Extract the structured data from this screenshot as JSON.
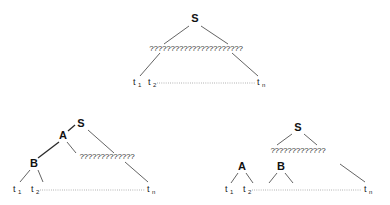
{
  "figure": {
    "title": "",
    "background_color": "#ffffff",
    "edge_color": "#3c3c3c",
    "label_color": "#111111",
    "baseline_color": "#7a7a7a"
  },
  "labels": {
    "S": "S",
    "A": "A",
    "B": "B",
    "t1": "t",
    "t1_sub": "1",
    "t2": "t",
    "t2_sub": "2",
    "tn": "t",
    "tn_sub": "n"
  },
  "diagrams": [
    {
      "id": "top-diagram",
      "name": "single-nonterminal-span",
      "root": "S",
      "squiggle": "??????????????????????",
      "terminals": [
        "t1",
        "t2",
        "tn"
      ]
    },
    {
      "id": "bottom-left-diagram",
      "name": "nested-nonterminals-span",
      "root": "S",
      "nodes": [
        "A",
        "B"
      ],
      "squiggle": "?????????????",
      "terminals": [
        "t1",
        "t2",
        "tn"
      ]
    },
    {
      "id": "bottom-right-diagram",
      "name": "sibling-nonterminals-span",
      "root": "S",
      "nodes": [
        "A",
        "B"
      ],
      "squiggle": "?????????????",
      "terminals": [
        "t1",
        "t2",
        "tn"
      ]
    }
  ]
}
